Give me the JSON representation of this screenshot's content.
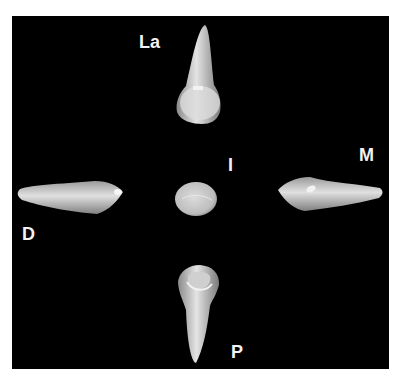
{
  "figure": {
    "background_color": "#000000",
    "tooth_color": "#d9d9d9",
    "labels": {
      "labial": "La",
      "mesial": "M",
      "incisal": "I",
      "distal": "D",
      "palatal": "P"
    }
  }
}
